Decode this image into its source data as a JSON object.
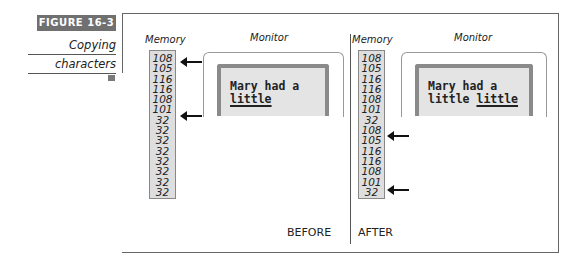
{
  "figure": {
    "label": "FIGURE 16-3",
    "caption_line1": "Copying",
    "caption_line2": "characters"
  },
  "before": {
    "memory_heading": "Memory",
    "monitor_heading": "Monitor",
    "memory": [
      "108",
      "105",
      "116",
      "116",
      "108",
      "101",
      "32",
      "32",
      "32",
      "32",
      "32",
      "32",
      "32",
      "32"
    ],
    "screen_line1": "Mary had a",
    "screen_line2_plain": "",
    "screen_line2_underlined": "little",
    "state_label": "BEFORE",
    "arrows_at_rows": [
      0,
      5
    ]
  },
  "after": {
    "memory_heading": "Memory",
    "monitor_heading": "Monitor",
    "memory": [
      "108",
      "105",
      "116",
      "116",
      "108",
      "101",
      "32",
      "108",
      "105",
      "116",
      "116",
      "108",
      "101",
      "32"
    ],
    "screen_line1": "Mary had a",
    "screen_line2_plain": "little ",
    "screen_line2_underlined": "little",
    "state_label": "AFTER",
    "arrows_at_rows": [
      7,
      12
    ]
  },
  "colors": {
    "figure_label_bg": "#707070",
    "memory_bg": "#dedede",
    "screen_bg": "#e4e4e4",
    "screen_bezel": "#8a8a8a"
  }
}
